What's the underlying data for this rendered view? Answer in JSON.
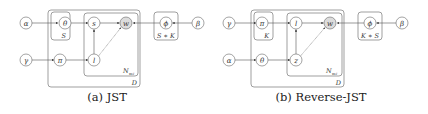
{
  "colors": {
    "stroke": "#666666",
    "observed_fill": "#dcdcdc",
    "node_fill": "#ffffff",
    "text": "#222222"
  },
  "figures": [
    {
      "id": "jst",
      "caption": "(a) JST",
      "nodes": {
        "alpha": "α",
        "gamma": "γ",
        "theta": "θ",
        "pi": "π",
        "s": "s",
        "l": "l",
        "w": "w",
        "phi": "ϕ",
        "beta": "β"
      },
      "plates": {
        "theta_plate": "S",
        "doc_plate": "D",
        "word_plate": "N",
        "word_plate_sub": "w",
        "word_plate_subsub": "d",
        "phi_plate": "S ∗ K"
      }
    },
    {
      "id": "reverse-jst",
      "caption": "(b) Reverse-JST",
      "nodes": {
        "gamma": "γ",
        "alpha": "α",
        "pi": "π",
        "theta": "θ",
        "l": "l",
        "z": "z",
        "w": "w",
        "phi": "ϕ",
        "beta": "β"
      },
      "plates": {
        "pi_plate": "K",
        "doc_plate": "D",
        "word_plate": "N",
        "word_plate_sub": "w",
        "word_plate_subsub": "d",
        "phi_plate": "K ∗ S"
      }
    }
  ]
}
